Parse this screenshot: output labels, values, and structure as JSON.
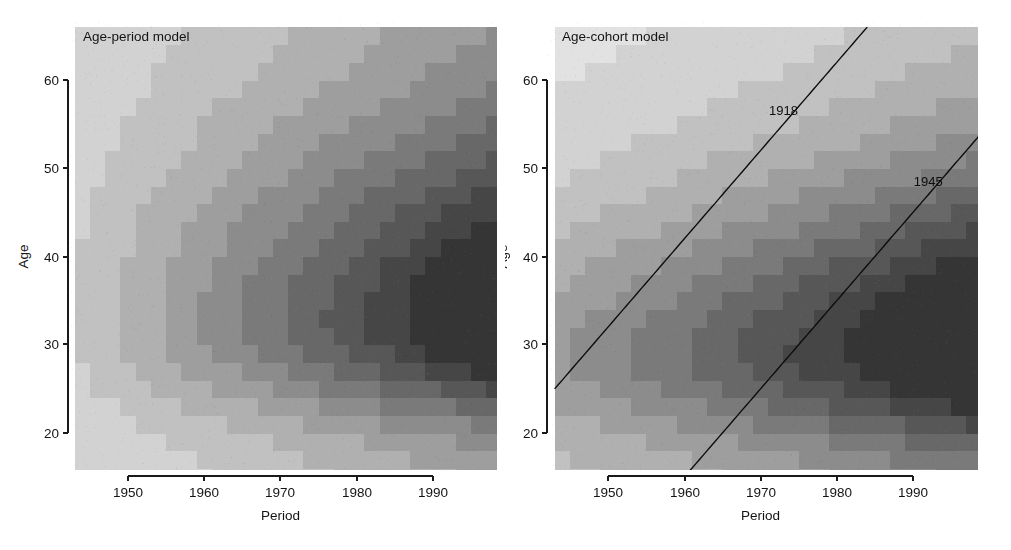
{
  "figure": {
    "width": 1011,
    "height": 550,
    "background": "#ffffff",
    "panel_count": 2
  },
  "chart_data": [
    {
      "id": "age-period",
      "type": "heatmap",
      "title": "Age-period model",
      "xlabel": "Period",
      "ylabel": "Age",
      "xlim": [
        1943,
        1999
      ],
      "ylim": [
        14,
        66
      ],
      "xticks": [
        1950,
        1960,
        1970,
        1980,
        1990
      ],
      "xticklabels": [
        "1950",
        "1960",
        "1970",
        "1980",
        "1990"
      ],
      "yticks": [
        20,
        30,
        40,
        50,
        60
      ],
      "yticklabels": [
        "20",
        "30",
        "40",
        "50",
        "60"
      ],
      "grid": false,
      "legend": "none",
      "colormap": "grayscale",
      "colormap_levels": [
        "#f2f2f2",
        "#e2e2e2",
        "#d2d2d2",
        "#c1c1c1",
        "#b0b0b0",
        "#9e9e9e",
        "#8c8c8c",
        "#7a7a7a",
        "#686868",
        "#575757",
        "#464646",
        "#353535"
      ],
      "surface_model": "age-period",
      "surface_note": "Contour-banded rate surface: rates increase with period and peak around age 30-35 in the most recent periods.",
      "cell_width_years": 2,
      "cell_height_years": 2,
      "peak_region": {
        "age": 33,
        "period": 1994,
        "level": 11
      },
      "cohort_lines": []
    },
    {
      "id": "age-cohort",
      "type": "heatmap",
      "title": "Age-cohort model",
      "xlabel": "Period",
      "ylabel": "Age",
      "xlim": [
        1943,
        1999
      ],
      "ylim": [
        14,
        66
      ],
      "xticks": [
        1950,
        1960,
        1970,
        1980,
        1990
      ],
      "xticklabels": [
        "1950",
        "1960",
        "1970",
        "1980",
        "1990"
      ],
      "yticks": [
        20,
        30,
        40,
        50,
        60
      ],
      "yticklabels": [
        "20",
        "30",
        "40",
        "50",
        "60"
      ],
      "grid": false,
      "legend": "none",
      "colormap": "grayscale",
      "colormap_levels": [
        "#f2f2f2",
        "#e2e2e2",
        "#d2d2d2",
        "#c1c1c1",
        "#b0b0b0",
        "#9e9e9e",
        "#8c8c8c",
        "#7a7a7a",
        "#686868",
        "#575757",
        "#464646",
        "#353535"
      ],
      "surface_model": "age-cohort",
      "surface_note": "Contour-banded rate surface with two annotated birth-cohort diagonals.",
      "cell_width_years": 2,
      "cell_height_years": 2,
      "peak_region": {
        "age": 31,
        "period": 1993,
        "level": 11
      },
      "cohort_lines": [
        {
          "label": "1918",
          "birth_year": 1918,
          "label_period": 1973,
          "label_age": 56
        },
        {
          "label": "1945",
          "birth_year": 1945,
          "label_period": 1992,
          "label_age": 48
        }
      ]
    }
  ]
}
